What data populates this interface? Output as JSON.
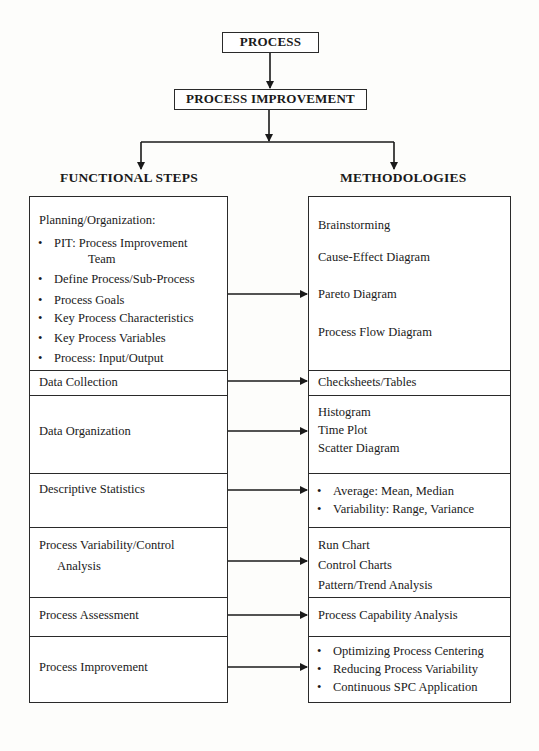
{
  "top": {
    "process_label": "PROCESS",
    "process_improvement_label": "PROCESS IMPROVEMENT"
  },
  "headings": {
    "left": "FUNCTIONAL STEPS",
    "right": "METHODOLOGIES"
  },
  "functional_steps": {
    "planning": {
      "title": "Planning/Organization:",
      "items": [
        {
          "label": "PIT:  Process Improvement",
          "continuation": "Team"
        },
        {
          "label": "Define Process/Sub-Process"
        },
        {
          "label": "Process Goals"
        },
        {
          "label": "Key Process Characteristics"
        },
        {
          "label": "Key Process Variables"
        },
        {
          "label": "Process:  Input/Output"
        }
      ]
    },
    "data_collection": "Data Collection",
    "data_organization": "Data Organization",
    "descriptive_statistics": "Descriptive Statistics",
    "process_variability": {
      "line1": "Process Variability/Control",
      "line2": "Analysis"
    },
    "process_assessment": "Process Assessment",
    "process_improvement": "Process Improvement"
  },
  "methodologies": {
    "planning": [
      "Brainstorming",
      "Cause-Effect Diagram",
      "Pareto Diagram",
      "Process Flow Diagram"
    ],
    "data_collection": "Checksheets/Tables",
    "data_organization": [
      "Histogram",
      "Time Plot",
      "Scatter Diagram"
    ],
    "descriptive_statistics": [
      "Average:  Mean, Median",
      "Variability:  Range, Variance"
    ],
    "process_variability": [
      "Run Chart",
      "Control Charts",
      "Pattern/Trend Analysis"
    ],
    "process_assessment": "Process Capability Analysis",
    "process_improvement": [
      "Optimizing Process Centering",
      "Reducing Process Variability",
      "Continuous SPC Application"
    ]
  },
  "colors": {
    "line": "#2a2a2a",
    "background": "#fdfdfb"
  }
}
